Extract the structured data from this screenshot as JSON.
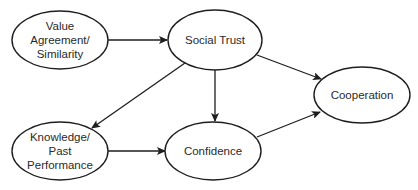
{
  "diagram": {
    "colors": {
      "stroke": "#1e1e1e",
      "text": "#2a2a2a",
      "background": "#ffffff"
    },
    "nodes": [
      {
        "id": "value",
        "label_lines": [
          "Value",
          "Agreement/",
          "Similarity"
        ],
        "cx": 60,
        "cy": 40,
        "rx": 48,
        "ry": 29
      },
      {
        "id": "trust",
        "label_lines": [
          "Social Trust"
        ],
        "cx": 215,
        "cy": 40,
        "rx": 47,
        "ry": 30
      },
      {
        "id": "cooperation",
        "label_lines": [
          "Cooperation"
        ],
        "cx": 362,
        "cy": 95,
        "rx": 48,
        "ry": 28
      },
      {
        "id": "knowledge",
        "label_lines": [
          "Knowledge/",
          "Past",
          "Performance"
        ],
        "cx": 60,
        "cy": 151,
        "rx": 48,
        "ry": 29
      },
      {
        "id": "confidence",
        "label_lines": [
          "Confidence"
        ],
        "cx": 213,
        "cy": 151,
        "rx": 48,
        "ry": 29
      }
    ],
    "edges": [
      {
        "from": "value",
        "to": "trust"
      },
      {
        "from": "trust",
        "to": "cooperation"
      },
      {
        "from": "trust",
        "to": "knowledge"
      },
      {
        "from": "trust",
        "to": "confidence"
      },
      {
        "from": "knowledge",
        "to": "confidence"
      },
      {
        "from": "confidence",
        "to": "cooperation"
      }
    ],
    "text": {
      "value_1": "Value",
      "value_2": "Agreement/",
      "value_3": "Similarity",
      "trust": "Social Trust",
      "cooperation": "Cooperation",
      "knowledge_1": "Knowledge/",
      "knowledge_2": "Past",
      "knowledge_3": "Performance",
      "confidence": "Confidence"
    }
  }
}
